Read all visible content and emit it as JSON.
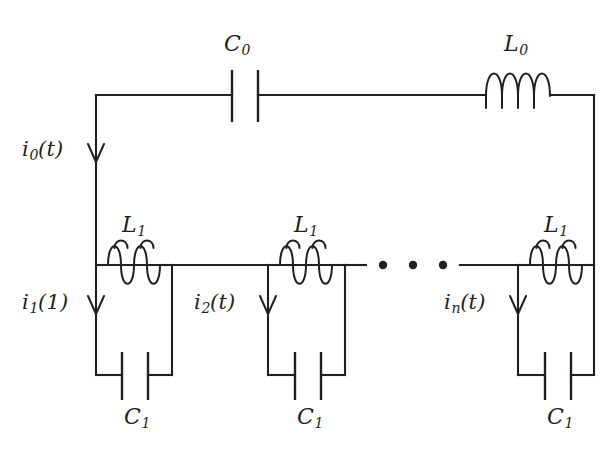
{
  "figure": {
    "name": "lc-ladder-network-diagram",
    "background_color": "#ffffff",
    "line_color": "#231f20",
    "width": 616,
    "height": 460
  },
  "components": {
    "c0": {
      "symbol": "C",
      "subscript": "0",
      "type": "capacitor"
    },
    "l0": {
      "symbol": "L",
      "subscript": "0",
      "type": "inductor"
    },
    "l1_cell1": {
      "symbol": "L",
      "subscript": "1",
      "type": "inductor"
    },
    "l1_cell2": {
      "symbol": "L",
      "subscript": "1",
      "type": "inductor"
    },
    "l1_celln": {
      "symbol": "L",
      "subscript": "1",
      "type": "inductor"
    },
    "c1_cell1": {
      "symbol": "C",
      "subscript": "1",
      "type": "capacitor"
    },
    "c1_cell2": {
      "symbol": "C",
      "subscript": "1",
      "type": "capacitor"
    },
    "c1_celln": {
      "symbol": "C",
      "subscript": "1",
      "type": "capacitor"
    }
  },
  "currents": {
    "i0": {
      "symbol": "i",
      "subscript": "0",
      "argument": "(t)"
    },
    "i1": {
      "symbol": "i",
      "subscript": "1",
      "argument": "(1)"
    },
    "i2": {
      "symbol": "i",
      "subscript": "2",
      "argument": "(t)"
    },
    "in": {
      "symbol": "i",
      "subscript": "n",
      "argument": "(t)"
    }
  },
  "ellipsis": {
    "label": "• • •",
    "dot_count": 3
  }
}
